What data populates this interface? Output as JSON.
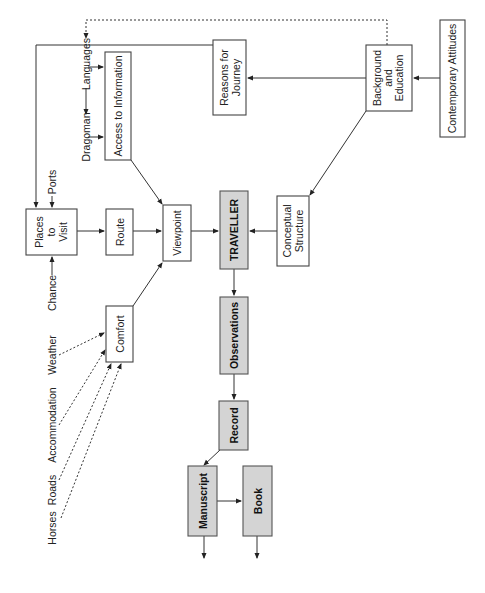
{
  "diagram": {
    "boxes": {
      "places_to_visit": [
        "Places",
        "to",
        "Visit"
      ],
      "route": "Route",
      "viewpoint": "Viewpoint",
      "traveller": "TRAVELLER",
      "conceptual_structure": [
        "Conceptual",
        "Structure"
      ],
      "access_to_information": "Access to Information",
      "reasons_for_journey": [
        "Reasons for",
        "Journey"
      ],
      "background_and_education": [
        "Background",
        "and",
        "Education"
      ],
      "contemporary_attitudes": "Contemporary Attitudes",
      "comfort": "Comfort",
      "observations": "Observations",
      "record": "Record",
      "manuscript": "Manuscript",
      "book": "Book"
    },
    "labels": {
      "languages": "Languages",
      "dragoman": "Dragoman",
      "ports": "Ports",
      "chance": "Chance",
      "weather": "Weather",
      "accommodation": "Accommodation",
      "roads": "Roads",
      "horses": "Horses"
    },
    "colors": {
      "shaded_box": "#d4d4d4",
      "line": "#333333"
    }
  }
}
